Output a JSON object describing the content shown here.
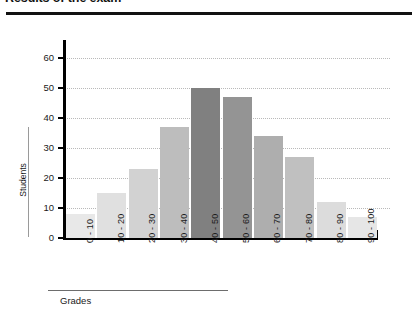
{
  "document": {
    "title": "Results of the exam"
  },
  "chart_data": {
    "type": "bar",
    "title": "Results of the exam",
    "xlabel": "Grades",
    "ylabel": "Students",
    "categories": [
      "0 - 10",
      "10 - 20",
      "20 - 30",
      "30 - 40",
      "40 - 50",
      "50 - 60",
      "60 - 70",
      "70 - 80",
      "80 - 90",
      "90 - 100"
    ],
    "values": [
      8,
      15,
      23,
      37,
      50,
      47,
      34,
      27,
      12,
      7
    ],
    "bar_colors": [
      "#e8e8e8",
      "#e0e0e0",
      "#d2d2d2",
      "#bdbdbd",
      "#808080",
      "#949494",
      "#aeaeae",
      "#c0c0c0",
      "#dcdcdc",
      "#e6e6e6"
    ],
    "ylim": [
      0,
      60
    ],
    "yticks": [
      0,
      10,
      20,
      30,
      40,
      50,
      60
    ],
    "ytick_labels": [
      "0",
      "10",
      "20",
      "30",
      "40",
      "50",
      "60"
    ],
    "grid": true,
    "grid_axis": "y",
    "grid_style": "dotted",
    "legend": false,
    "axis_color": "#000000",
    "grid_color": "#b9b9b9"
  }
}
